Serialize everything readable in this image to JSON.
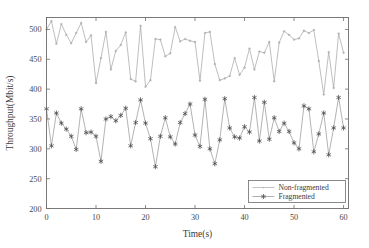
{
  "chart_data": {
    "type": "line",
    "title": "",
    "xlabel": "Time(s)",
    "ylabel": "Throughput(Mbit/s)",
    "xlim": [
      0,
      61
    ],
    "ylim": [
      200,
      520
    ],
    "xticks": [
      0,
      10,
      20,
      30,
      40,
      50,
      60
    ],
    "xtick_labels": [
      "0",
      "10",
      "20",
      "30",
      "40",
      "50",
      "60"
    ],
    "yticks": [
      200,
      250,
      300,
      350,
      400,
      450,
      500
    ],
    "ytick_labels": [
      "200",
      "250",
      "300",
      "350",
      "400",
      "450",
      "500"
    ],
    "grid": false,
    "legend_position": "lower right",
    "legend_entries": [
      "Non-fragmented",
      "Fragmented"
    ],
    "x": [
      0,
      1,
      2,
      3,
      4,
      5,
      6,
      7,
      8,
      9,
      10,
      11,
      12,
      13,
      14,
      15,
      16,
      17,
      18,
      19,
      20,
      21,
      22,
      23,
      24,
      25,
      26,
      27,
      28,
      29,
      30,
      31,
      32,
      33,
      34,
      35,
      36,
      37,
      38,
      39,
      40,
      41,
      42,
      43,
      44,
      45,
      46,
      47,
      48,
      49,
      50,
      51,
      52,
      53,
      54,
      55,
      56,
      57,
      58,
      59,
      60
    ],
    "series": [
      {
        "name": "Non-fragmented",
        "marker": "dot",
        "color": "#a8a8a8",
        "values": [
          500,
          514,
          476,
          509,
          491,
          477,
          494,
          511,
          479,
          490,
          410,
          452,
          496,
          433,
          464,
          474,
          495,
          417,
          413,
          506,
          404,
          415,
          484,
          483,
          455,
          460,
          504,
          480,
          484,
          481,
          479,
          414,
          494,
          496,
          442,
          415,
          418,
          422,
          452,
          424,
          436,
          468,
          433,
          463,
          461,
          479,
          413,
          478,
          497,
          491,
          483,
          485,
          498,
          494,
          499,
          447,
          391,
          462,
          402,
          493,
          461
        ]
      },
      {
        "name": "Fragmented",
        "marker": "star",
        "color": "#4a4a4a",
        "values": [
          367,
          305,
          360,
          343,
          333,
          321,
          299,
          367,
          327,
          328,
          321,
          279,
          350,
          354,
          347,
          356,
          368,
          305,
          344,
          382,
          343,
          317,
          270,
          321,
          352,
          320,
          308,
          344,
          359,
          375,
          323,
          304,
          383,
          300,
          275,
          315,
          384,
          335,
          320,
          318,
          337,
          328,
          386,
          313,
          378,
          316,
          352,
          329,
          343,
          329,
          310,
          300,
          372,
          367,
          295,
          325,
          360,
          290,
          335,
          386,
          335
        ]
      }
    ]
  }
}
